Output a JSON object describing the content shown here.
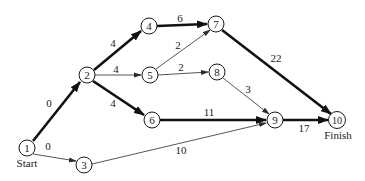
{
  "diagram": {
    "type": "project-network",
    "nodes": [
      {
        "id": "1",
        "label": "1",
        "x": 27,
        "y": 148,
        "caption": "Start"
      },
      {
        "id": "2",
        "label": "2",
        "x": 87,
        "y": 75
      },
      {
        "id": "3",
        "label": "3",
        "x": 84,
        "y": 165
      },
      {
        "id": "4",
        "label": "4",
        "x": 149,
        "y": 26
      },
      {
        "id": "5",
        "label": "5",
        "x": 150,
        "y": 75
      },
      {
        "id": "6",
        "label": "6",
        "x": 152,
        "y": 120
      },
      {
        "id": "7",
        "label": "7",
        "x": 216,
        "y": 24
      },
      {
        "id": "8",
        "label": "8",
        "x": 217,
        "y": 72
      },
      {
        "id": "9",
        "label": "9",
        "x": 275,
        "y": 120
      },
      {
        "id": "10",
        "label": "10",
        "x": 337,
        "y": 120,
        "caption": "Finish"
      }
    ],
    "edges": [
      {
        "from": "1",
        "to": "2",
        "weight": "0",
        "critical": true
      },
      {
        "from": "1",
        "to": "3",
        "weight": "0",
        "critical": false
      },
      {
        "from": "2",
        "to": "4",
        "weight": "4",
        "critical": true
      },
      {
        "from": "2",
        "to": "5",
        "weight": "4",
        "critical": false
      },
      {
        "from": "2",
        "to": "6",
        "weight": "4",
        "critical": true
      },
      {
        "from": "4",
        "to": "7",
        "weight": "6",
        "critical": true
      },
      {
        "from": "5",
        "to": "7",
        "weight": "2",
        "critical": false
      },
      {
        "from": "5",
        "to": "8",
        "weight": "2",
        "critical": false
      },
      {
        "from": "6",
        "to": "9",
        "weight": "11",
        "critical": true
      },
      {
        "from": "3",
        "to": "9",
        "weight": "10",
        "critical": false
      },
      {
        "from": "8",
        "to": "9",
        "weight": "3",
        "critical": false
      },
      {
        "from": "7",
        "to": "10",
        "weight": "22",
        "critical": true
      },
      {
        "from": "9",
        "to": "10",
        "weight": "17",
        "critical": true
      }
    ],
    "labels": {
      "start": "Start",
      "finish": "Finish",
      "n1": "1",
      "n2": "2",
      "n3": "3",
      "n4": "4",
      "n5": "5",
      "n6": "6",
      "n7": "7",
      "n8": "8",
      "n9": "9",
      "n10": "10",
      "e12": "0",
      "e13": "0",
      "e24": "4",
      "e25": "4",
      "e26": "4",
      "e47": "6",
      "e57": "2",
      "e58": "2",
      "e69": "11",
      "e39": "10",
      "e89": "3",
      "e710": "22",
      "e910": "17"
    },
    "colors": {
      "line": "#1a1a1a",
      "background": "#ffffff"
    }
  }
}
